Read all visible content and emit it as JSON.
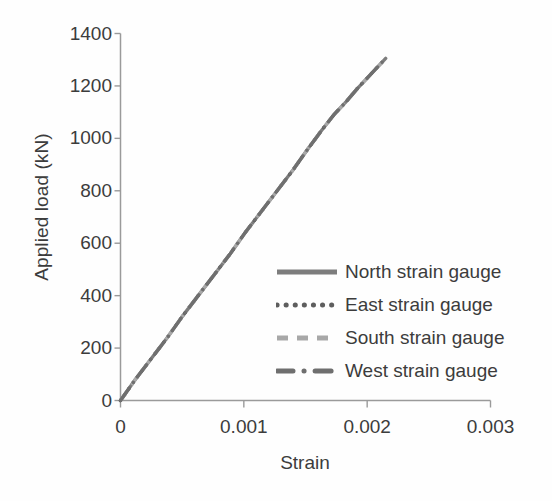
{
  "chart_data": {
    "type": "line",
    "title": "",
    "xlabel": "Strain",
    "ylabel": "Applied load (kN)",
    "xlim": [
      0,
      0.003
    ],
    "ylim": [
      0,
      1400
    ],
    "xticks": [
      "0",
      "0.001",
      "0.002",
      "0.003"
    ],
    "xtick_values": [
      0,
      0.001,
      0.002,
      0.003
    ],
    "yticks": [
      "0",
      "200",
      "400",
      "600",
      "800",
      "1000",
      "1200",
      "1400"
    ],
    "ytick_values": [
      0,
      200,
      400,
      600,
      800,
      1000,
      1200,
      1400
    ],
    "grid": false,
    "legend_position": "inside lower-right",
    "series": [
      {
        "name": "North strain gauge",
        "style": "solid",
        "color": "#7d7d7d",
        "x": [
          0,
          0.00012,
          0.00025,
          0.00038,
          0.0005,
          0.00063,
          0.00076,
          0.00089,
          0.00101,
          0.00114,
          0.00127,
          0.0014,
          0.00152,
          0.00163,
          0.00173,
          0.00183,
          0.00192,
          0.002,
          0.00207,
          0.00212,
          0.00215
        ],
        "y": [
          0,
          80,
          160,
          240,
          320,
          400,
          480,
          560,
          640,
          720,
          800,
          880,
          960,
          1030,
          1090,
          1140,
          1190,
          1230,
          1265,
          1290,
          1305
        ]
      },
      {
        "name": "East strain gauge",
        "style": "dotted",
        "color": "#5e5e5e",
        "x": [
          0,
          0.00012,
          0.00025,
          0.00038,
          0.0005,
          0.00063,
          0.00076,
          0.00089,
          0.00101,
          0.00114,
          0.00127,
          0.0014,
          0.00152,
          0.00163,
          0.00173,
          0.00183,
          0.00192,
          0.002,
          0.00207,
          0.00212,
          0.00215
        ],
        "y": [
          0,
          80,
          160,
          240,
          320,
          400,
          480,
          560,
          640,
          720,
          800,
          880,
          960,
          1030,
          1090,
          1140,
          1190,
          1230,
          1265,
          1290,
          1305
        ]
      },
      {
        "name": "South strain gauge",
        "style": "dashed",
        "color": "#a8a8a8",
        "x": [
          0,
          0.00012,
          0.00025,
          0.00038,
          0.0005,
          0.00063,
          0.00076,
          0.00089,
          0.00101,
          0.00114,
          0.00127,
          0.0014,
          0.00152,
          0.00163,
          0.00173,
          0.00183,
          0.00192,
          0.002,
          0.00207,
          0.00212,
          0.00215
        ],
        "y": [
          0,
          80,
          160,
          240,
          320,
          400,
          480,
          560,
          640,
          720,
          800,
          880,
          960,
          1030,
          1090,
          1140,
          1190,
          1230,
          1265,
          1290,
          1305
        ]
      },
      {
        "name": "West strain gauge",
        "style": "dashdot",
        "color": "#6f6f6f",
        "x": [
          0,
          0.00012,
          0.00025,
          0.00038,
          0.0005,
          0.00063,
          0.00076,
          0.00089,
          0.00101,
          0.00114,
          0.00127,
          0.0014,
          0.00152,
          0.00163,
          0.00173,
          0.00183,
          0.00192,
          0.002,
          0.00207,
          0.00212,
          0.00215
        ],
        "y": [
          0,
          80,
          160,
          240,
          320,
          400,
          480,
          560,
          640,
          720,
          800,
          880,
          960,
          1030,
          1090,
          1140,
          1190,
          1230,
          1265,
          1290,
          1305
        ]
      }
    ]
  },
  "legend": {
    "items": [
      {
        "label": "North strain gauge",
        "style": "solid",
        "color": "#7d7d7d"
      },
      {
        "label": "East strain gauge",
        "style": "dotted",
        "color": "#5e5e5e"
      },
      {
        "label": "South strain gauge",
        "style": "dashed",
        "color": "#a8a8a8"
      },
      {
        "label": "West strain gauge",
        "style": "dashdot",
        "color": "#6f6f6f"
      }
    ]
  },
  "axes": {
    "axis_color": "#9a9a9a"
  }
}
